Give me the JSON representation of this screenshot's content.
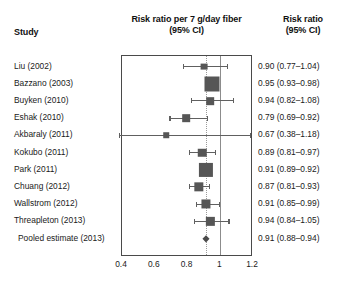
{
  "headers": {
    "study": "Study",
    "plot_line1": "Risk ratio per 7 g/day fiber",
    "plot_line2": "(95% CI)",
    "result_line1": "Risk ratio",
    "result_line2": "(95% CI)"
  },
  "axis": {
    "ticks": [
      "0.4",
      "0.6",
      "0.8",
      "1",
      "1.2"
    ],
    "tick_values": [
      0.4,
      0.6,
      0.8,
      1.0,
      1.2
    ],
    "xmin": 0.4,
    "xmax": 1.2,
    "reference_line": 1.0,
    "pooled_line": 0.91
  },
  "colors": {
    "marker": "#565656",
    "ci_line": "#606060",
    "box_border": "#4a4a4a",
    "reference_line": "#8c8c8c",
    "pooled_line": "#9a9a9a",
    "text": "#1a1a1a",
    "background": "#ffffff"
  },
  "chart_data": {
    "type": "forest",
    "title": "Risk ratio per 7 g/day fiber (95% CI)",
    "xlabel": "",
    "ylabel": "",
    "xlim": [
      0.4,
      1.2
    ],
    "xticks": [
      0.4,
      0.6,
      0.8,
      1.0,
      1.2
    ],
    "grid": false,
    "legend": "none",
    "reference_line": 1.0,
    "pooled_line": 0.91,
    "categories": [
      "Liu (2002)",
      "Bazzano (2003)",
      "Buyken (2010)",
      "Eshak (2010)",
      "Akbaraly (2011)",
      "Kokubo (2011)",
      "Park (2011)",
      "Chuang (2012)",
      "Wallstrom (2012)",
      "Threapleton (2013)",
      "Pooled estimate (2013)"
    ],
    "rows": [
      {
        "study": "Liu (2002)",
        "estimate": 0.9,
        "ci_low": 0.77,
        "ci_high": 1.04,
        "label": "0.90 (0.77–1.04)",
        "weight": 0.22,
        "marker": "square"
      },
      {
        "study": "Bazzano (2003)",
        "estimate": 0.95,
        "ci_low": 0.93,
        "ci_high": 0.98,
        "label": "0.95 (0.93–0.98)",
        "weight": 1.0,
        "marker": "square"
      },
      {
        "study": "Buyken (2010)",
        "estimate": 0.94,
        "ci_low": 0.82,
        "ci_high": 1.08,
        "label": "0.94 (0.82–1.08)",
        "weight": 0.3,
        "marker": "square"
      },
      {
        "study": "Eshak (2010)",
        "estimate": 0.79,
        "ci_low": 0.69,
        "ci_high": 0.92,
        "label": "0.79 (0.69–0.92)",
        "weight": 0.3,
        "marker": "square"
      },
      {
        "study": "Akbaraly (2011)",
        "estimate": 0.67,
        "ci_low": 0.38,
        "ci_high": 1.18,
        "label": "0.67 (0.38–1.18)",
        "weight": 0.1,
        "marker": "square"
      },
      {
        "study": "Kokubo (2011)",
        "estimate": 0.89,
        "ci_low": 0.81,
        "ci_high": 0.97,
        "label": "0.89 (0.81–0.97)",
        "weight": 0.38,
        "marker": "square"
      },
      {
        "study": "Park (2011)",
        "estimate": 0.91,
        "ci_low": 0.89,
        "ci_high": 0.92,
        "label": "0.91 (0.89–0.92)",
        "weight": 0.92,
        "marker": "square"
      },
      {
        "study": "Chuang (2012)",
        "estimate": 0.87,
        "ci_low": 0.81,
        "ci_high": 0.93,
        "label": "0.87 (0.81–0.93)",
        "weight": 0.46,
        "marker": "square"
      },
      {
        "study": "Wallstrom (2012)",
        "estimate": 0.91,
        "ci_low": 0.85,
        "ci_high": 0.99,
        "label": "0.91 (0.85–0.99)",
        "weight": 0.44,
        "marker": "square"
      },
      {
        "study": "Threapleton (2013)",
        "estimate": 0.94,
        "ci_low": 0.84,
        "ci_high": 1.05,
        "label": "0.94 (0.84–1.05)",
        "weight": 0.36,
        "marker": "square"
      },
      {
        "study": "Pooled estimate (2013)",
        "estimate": 0.91,
        "ci_low": 0.88,
        "ci_high": 0.94,
        "label": "0.91 (0.88–0.94)",
        "weight": 0.3,
        "marker": "diamond"
      }
    ]
  }
}
